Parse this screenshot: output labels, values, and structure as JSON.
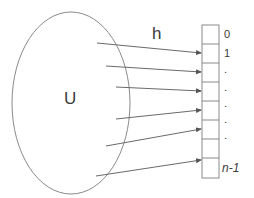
{
  "diagram": {
    "universe_label": "U",
    "function_label": "h",
    "table": {
      "slot_labels": [
        "0",
        "1",
        ".",
        ".",
        ".",
        ".",
        ".",
        "n-1"
      ],
      "slot_count": 8
    },
    "arrows_count": 6,
    "colors": {
      "stroke": "#7a7a7a",
      "text": "#3a3a3a",
      "background": "#ffffff"
    }
  }
}
